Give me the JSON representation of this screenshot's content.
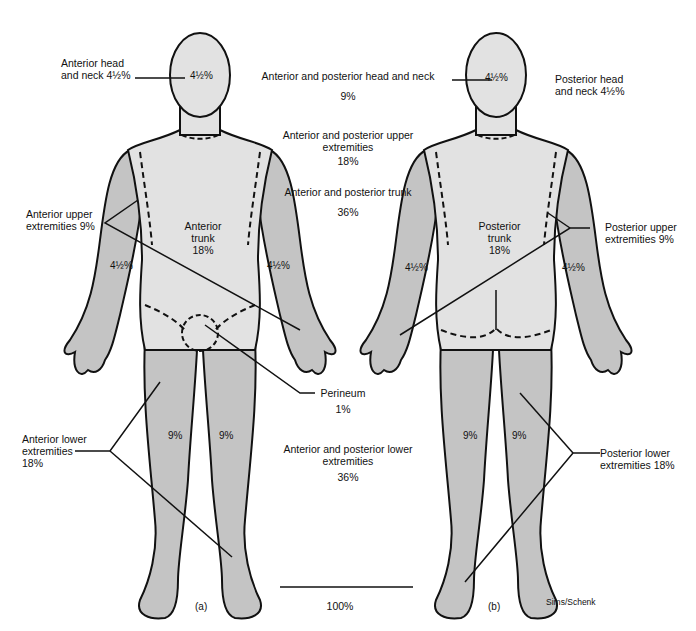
{
  "figure": {
    "colors": {
      "upper_region": "#e2e2e2",
      "limb_region": "#c4c4c4",
      "outline": "#111111",
      "background": "#ffffff"
    },
    "front_view": {
      "caption": "(a)",
      "head_pct": "4½%",
      "trunk_label": "Anterior",
      "trunk_label2": "trunk",
      "trunk_pct": "18%",
      "left_arm_pct": "4½%",
      "right_arm_pct": "4½%",
      "left_leg_pct": "9%",
      "right_leg_pct": "9%"
    },
    "back_view": {
      "caption": "(b)",
      "head_pct": "4½%",
      "trunk_label": "Posterior",
      "trunk_label2": "trunk",
      "trunk_pct": "18%",
      "left_arm_pct": "4½%",
      "right_arm_pct": "4½%",
      "left_leg_pct": "9%",
      "right_leg_pct": "9%"
    },
    "callouts": {
      "anterior_head": [
        "Anterior head",
        "and neck 4½%"
      ],
      "anterior_upper": [
        "Anterior upper",
        "extremities 9%"
      ],
      "perineum": [
        "Perineum",
        "1%"
      ],
      "anterior_lower": [
        "Anterior lower",
        "extremities",
        "18%"
      ],
      "posterior_head": [
        "Posterior head",
        "and neck 4½%"
      ],
      "posterior_upper": [
        "Posterior upper",
        "extremities 9%"
      ],
      "posterior_lower": [
        "Posterior lower",
        "extremities 18%"
      ]
    },
    "summary": [
      {
        "label": "Anterior and posterior head and neck",
        "value": "9%"
      },
      {
        "label": "Anterior and posterior upper",
        "label2": "extremities",
        "value": "18%"
      },
      {
        "label": "Anterior and posterior trunk",
        "value": "36%"
      },
      {
        "label": "Anterior and posterior lower",
        "label2": "extremities",
        "value": "36%"
      }
    ],
    "total": "100%",
    "credit": "Sims/Schenk"
  }
}
